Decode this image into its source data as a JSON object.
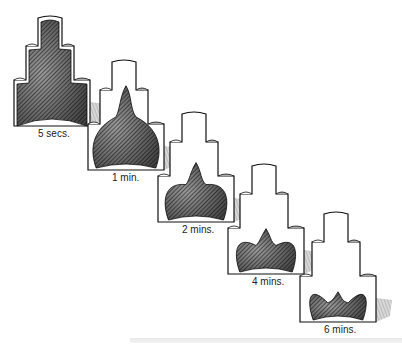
{
  "diagram": {
    "title": "",
    "stages": [
      {
        "label": "5 secs.",
        "x": 14,
        "y": 14,
        "fill": 1.0
      },
      {
        "label": "1 min.",
        "x": 88,
        "y": 58,
        "fill": 0.78
      },
      {
        "label": "2 mins.",
        "x": 158,
        "y": 110,
        "fill": 0.55
      },
      {
        "label": "4 mins.",
        "x": 228,
        "y": 162,
        "fill": 0.42
      },
      {
        "label": "6 mins.",
        "x": 300,
        "y": 210,
        "fill": 0.28
      }
    ],
    "colors": {
      "outline": "#111111",
      "hatch_dark": "#2a2a2a",
      "hatch_light": "#8a8a8a",
      "shadow": "#b0b0b0"
    }
  }
}
